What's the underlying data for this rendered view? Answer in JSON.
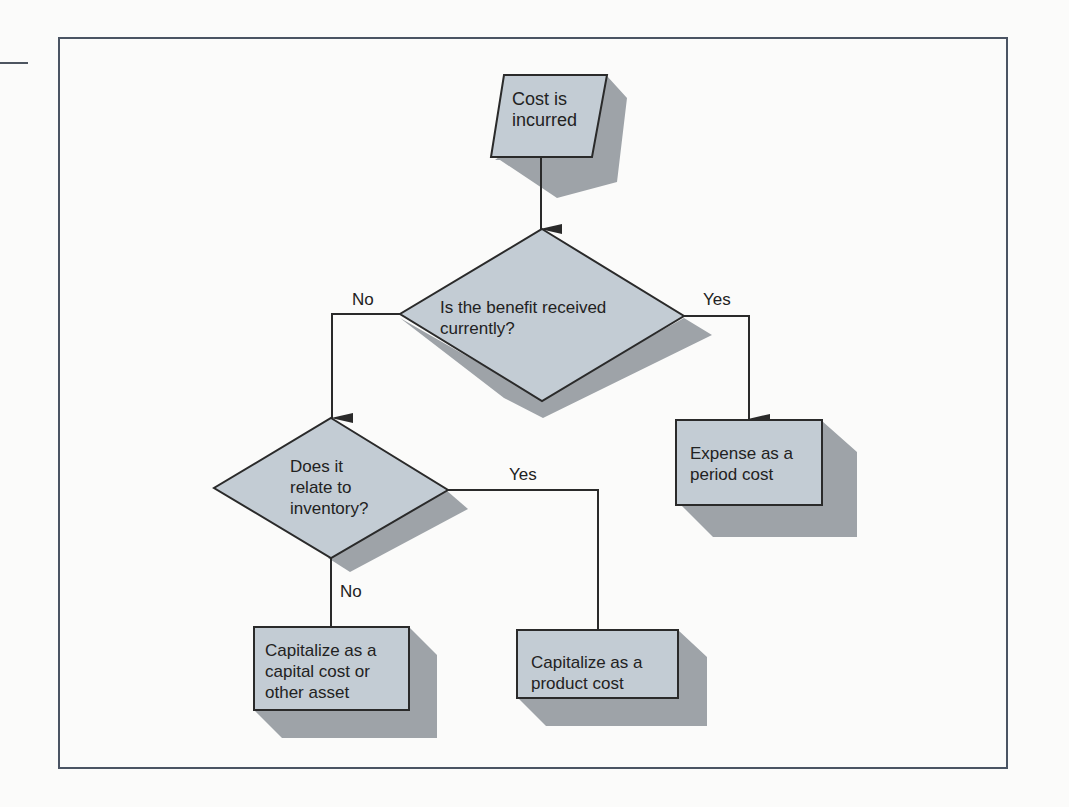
{
  "figure": {
    "type": "flowchart",
    "colors": {
      "node_fill": "#c3ccd4",
      "node_shadow": "#9ea3a8",
      "stroke": "#2a2a2a",
      "frame": "#4a5463",
      "background": "#fbfbfa"
    },
    "nodes": [
      {
        "id": "start",
        "shape": "parallelogram",
        "label": "Cost is\nincurred"
      },
      {
        "id": "q1",
        "shape": "diamond",
        "label": "Is the benefit received\ncurrently?"
      },
      {
        "id": "q2",
        "shape": "diamond",
        "label": "Does it\nrelate to\ninventory?"
      },
      {
        "id": "period",
        "shape": "rectangle",
        "label": "Expense as a\nperiod cost"
      },
      {
        "id": "capital",
        "shape": "rectangle",
        "label": "Capitalize as a\ncapital cost or\nother asset"
      },
      {
        "id": "product",
        "shape": "rectangle",
        "label": "Capitalize as a\nproduct cost"
      }
    ],
    "edges": [
      {
        "from": "start",
        "to": "q1",
        "label": ""
      },
      {
        "from": "q1",
        "to": "q2",
        "label": "No"
      },
      {
        "from": "q1",
        "to": "period",
        "label": "Yes"
      },
      {
        "from": "q2",
        "to": "product",
        "label": "Yes"
      },
      {
        "from": "q2",
        "to": "capital",
        "label": "No"
      }
    ]
  }
}
